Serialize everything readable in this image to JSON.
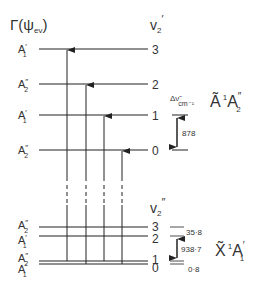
{
  "header": {
    "gamma_label": "Γ(ψ",
    "gamma_sub": "ev",
    "gamma_close": ")",
    "upper_v_label": "v",
    "upper_v_sub": "2",
    "upper_v_prime": "′",
    "lower_v_label": "v",
    "lower_v_sub": "2",
    "lower_v_prime": "″"
  },
  "upper_state": {
    "name": "Ã",
    "spin": "1",
    "sym": "A",
    "sym_prime": "″",
    "sym_sub": "2",
    "delta_label": "Δν̃",
    "delta_unit": "cm⁻¹",
    "spacing": "878",
    "levels": [
      {
        "v": "3",
        "sym": "A",
        "prime": "′",
        "sub": "1",
        "y": 49
      },
      {
        "v": "2",
        "sym": "A",
        "prime": "″",
        "sub": "2",
        "y": 84
      },
      {
        "v": "1",
        "sym": "A",
        "prime": "′",
        "sub": "1",
        "y": 115
      },
      {
        "v": "0",
        "sym": "A",
        "prime": "″",
        "sub": "2",
        "y": 150
      }
    ]
  },
  "lower_state": {
    "name": "X̃",
    "spin": "1",
    "sym": "A",
    "sym_prime": "′",
    "sym_sub": "1",
    "splitting_upper": "35·8",
    "spacing": "938·7",
    "splitting_lower": "0·8",
    "levels": [
      {
        "v": "3",
        "sym": "A",
        "prime": "″",
        "sub": "2",
        "y": 227
      },
      {
        "v": "2",
        "sym": "A",
        "prime": "′",
        "sub": "1",
        "y": 236
      },
      {
        "v": "1",
        "sym": "A",
        "prime": "″",
        "sub": "2",
        "y": 261
      },
      {
        "v": "0",
        "sym": "A",
        "prime": "′",
        "sub": "1",
        "y": 264
      }
    ]
  },
  "transitions": [
    {
      "x": 67,
      "from_y": 261,
      "to_y": 49
    },
    {
      "x": 86,
      "from_y": 264,
      "to_y": 84
    },
    {
      "x": 104,
      "from_y": 261,
      "to_y": 115
    },
    {
      "x": 122,
      "from_y": 264,
      "to_y": 150
    }
  ]
}
